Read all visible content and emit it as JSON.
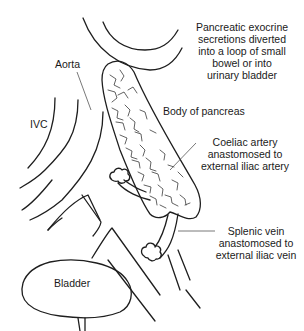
{
  "diagram": {
    "type": "anatomical illustration",
    "colors": {
      "line": "#1e1e1e",
      "background": "#ffffff"
    },
    "labels": {
      "exocrine": "Pancreatic exocrine\nsecretions diverted\ninto a loop of small\nbowel or into\nurinary bladder",
      "aorta": "Aorta",
      "ivc": "IVC",
      "body_of_pancreas": "Body of pancreas",
      "coeliac": "Coeliac artery\nanastomosed to\nexternal iliac artery",
      "splenic": "Splenic vein\nanastomosed to\nexternal iliac vein",
      "bladder": "Bladder"
    }
  }
}
